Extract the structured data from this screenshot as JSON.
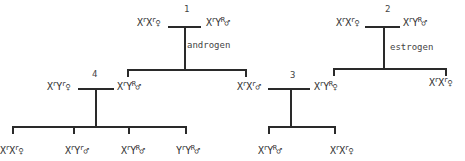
{
  "crosses": [
    {
      "number": "1",
      "treatment": "androgen",
      "female": {
        "base": "X",
        "s1": "r",
        "b2": "X",
        "s2": "r",
        "sex": "♀"
      },
      "male": {
        "base": "X",
        "s1": "r",
        "b2": "Y",
        "s2": "R",
        "sex": "♂"
      }
    },
    {
      "number": "2",
      "treatment": "estrogen",
      "female": {
        "base": "X",
        "s1": "r",
        "b2": "X",
        "s2": "r",
        "sex": "♀"
      },
      "male": {
        "base": "X",
        "s1": "r",
        "b2": "Y",
        "s2": "R",
        "sex": "♂"
      }
    },
    {
      "number": "3",
      "female_parent": {
        "base": "X",
        "s1": "r",
        "b2": "X",
        "s2": "r",
        "sex": "♂"
      },
      "male_parent": {
        "base": "X",
        "s1": "r",
        "b2": "Y",
        "s2": "R",
        "sex": "♀"
      }
    },
    {
      "number": "4",
      "female_parent": {
        "base": "X",
        "s1": "r",
        "b2": "Y",
        "s2": "r",
        "sex": "♀"
      },
      "male_parent": {
        "base": "X",
        "s1": "r",
        "b2": "Y",
        "s2": "R",
        "sex": "♂"
      }
    }
  ],
  "offspring_4": [
    {
      "base": "X",
      "s1": "r",
      "b2": "X",
      "s2": "r",
      "sex": "♀"
    },
    {
      "base": "X",
      "s1": "r",
      "b2": "Y",
      "s2": "r",
      "sex": "♂"
    },
    {
      "base": "X",
      "s1": "r",
      "b2": "Y",
      "s2": "R",
      "sex": "♂"
    },
    {
      "base": "Y",
      "s1": "r",
      "b2": "Y",
      "s2": "R",
      "sex": "♂"
    }
  ],
  "offspring_3": [
    {
      "base": "X",
      "s1": "r",
      "b2": "Y",
      "s2": "R",
      "sex": "♂"
    },
    {
      "base": "X",
      "s1": "r",
      "b2": "X",
      "s2": "r",
      "sex": "♀"
    }
  ],
  "offspring_2_right": {
    "base": "X",
    "s1": "r",
    "b2": "X",
    "s2": "r",
    "sex": "♀"
  }
}
